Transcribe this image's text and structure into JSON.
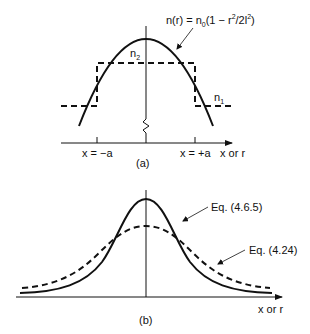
{
  "panel_a": {
    "caption": "(a)",
    "formula": {
      "lhs": "n(r) = n",
      "sub0": "0",
      "mid": "(1 − r",
      "sup2a": "2",
      "mid2": "/2l",
      "sup2b": "2",
      "end": ")"
    },
    "n2_label": {
      "base": "n",
      "sub": "2"
    },
    "n1_label": {
      "base": "n",
      "sub": "1"
    },
    "tick_left_label": "x = −a",
    "tick_right_label": "x = +a",
    "axis_label": "x or r",
    "curves": [
      {
        "name": "parabolic index profile",
        "style": "solid",
        "formula": "n(r) = n0(1 − r²/2l²)"
      },
      {
        "name": "step index profile",
        "style": "dashed",
        "levels": [
          "n2 (core, |x|<a)",
          "n1 (cladding, |x|>a)"
        ]
      }
    ]
  },
  "panel_b": {
    "caption": "(b)",
    "label_solid": "Eq. (4.6.5)",
    "label_dashed": "Eq. (4.24)",
    "axis_label": "x or r",
    "curves": [
      {
        "name": "Eq. (4.6.5)",
        "style": "solid",
        "shape": "gaussian, narrow, taller peak"
      },
      {
        "name": "Eq. (4.24)",
        "style": "dashed",
        "shape": "broader, lower peak"
      }
    ]
  },
  "colors": {
    "ink": "#111111",
    "background": "#ffffff"
  }
}
